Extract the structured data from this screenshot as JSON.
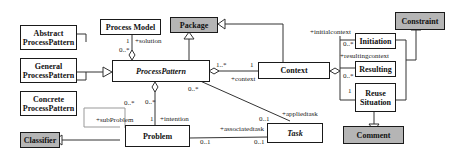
{
  "diagram": {
    "type": "UML class diagram",
    "classes": {
      "abstract_pp": "Abstract ProcessPattern",
      "general_pp": "General ProcessPattern",
      "concrete_pp": "Concrete ProcessPattern",
      "process_model": "Process Model",
      "package": "Package",
      "process_pattern": "ProcessPattern",
      "context": "Context",
      "constraint": "Constraint",
      "initiation": "Initiation",
      "resulting": "Resulting",
      "reuse_situation": "Reuse Situation",
      "comment": "Comment",
      "classifier": "Classifier",
      "problem": "Problem",
      "task": "Task"
    },
    "labels": {
      "solution_mult": "1",
      "solution_role": "+solution",
      "pm_pp_mult": "0..*",
      "pp_ctx_mult": "1..*",
      "ctx_mult": "1",
      "context_role": "+context",
      "initialcontext_role": "+initialcontext",
      "initiation_mult": "0..*",
      "resultingcontext_role": "+resultingcontext",
      "resulting_mult": "0..*",
      "reuse_mult": "1",
      "pp_task_mult": "0..*",
      "appliedtask_role": "+appliedtask",
      "task_applied_mult": "0..1",
      "associatedtask_role": "+associatedtask",
      "problem_task_mult": "0..1",
      "task_assoc_mult": "0..1",
      "pp_problem_mult": "0..*",
      "intention_mult": "1",
      "intention_role": "+intention",
      "subproblem_mult": "0..*",
      "subproblem_role": "+subProblem"
    }
  }
}
